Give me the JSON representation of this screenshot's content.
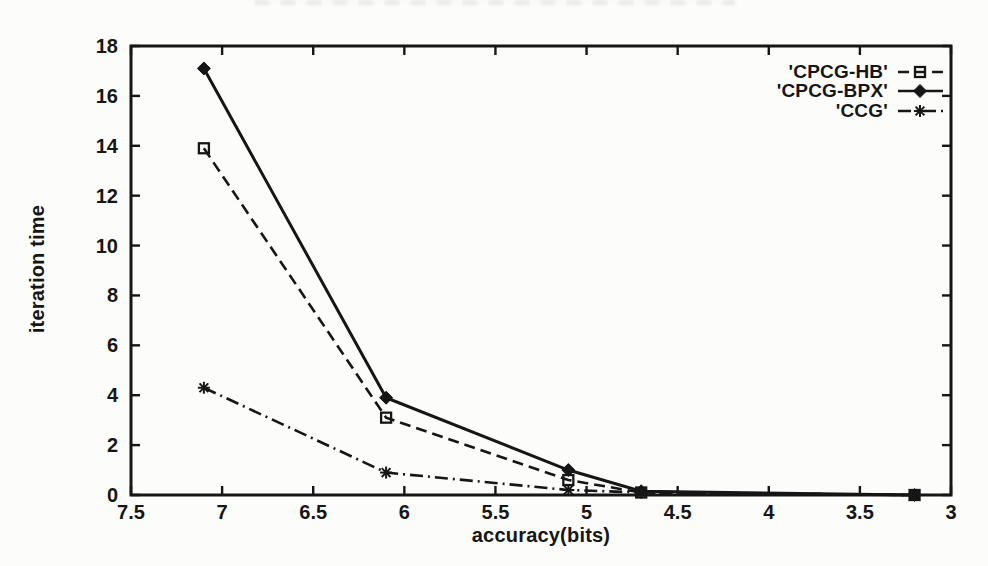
{
  "figure": {
    "background": "#fcfcfb",
    "ink_color": "#161616"
  },
  "chart_data": {
    "type": "line",
    "title": "",
    "xlabel": "accuracy(bits)",
    "ylabel": "iteration time",
    "grid": false,
    "legend_position": "top-right-inside",
    "x_axis": {
      "min": 7.5,
      "max": 3,
      "reversed": true,
      "tick_labels": [
        "7.5",
        "7",
        "6.5",
        "6",
        "5.5",
        "5",
        "4.5",
        "4",
        "3.5",
        "3"
      ],
      "ticks": [
        7.5,
        7,
        6.5,
        6,
        5.5,
        5,
        4.5,
        4,
        3.5,
        3
      ]
    },
    "y_axis": {
      "min": 0,
      "max": 18,
      "tick_labels": [
        "0",
        "2",
        "4",
        "6",
        "8",
        "10",
        "12",
        "14",
        "16",
        "18"
      ],
      "ticks": [
        0,
        2,
        4,
        6,
        8,
        10,
        12,
        14,
        16,
        18
      ]
    },
    "x": [
      7.1,
      6.1,
      5.1,
      4.7,
      3.2
    ],
    "series": [
      {
        "name": "'CPCG-HB'",
        "values": [
          13.9,
          3.1,
          0.6,
          0.1,
          0.0
        ],
        "line_style": "dashed",
        "marker": "open-square"
      },
      {
        "name": "'CPCG-BPX'",
        "values": [
          17.1,
          3.9,
          1.0,
          0.15,
          0.0
        ],
        "line_style": "solid",
        "marker": "filled-diamond"
      },
      {
        "name": "'CCG'",
        "values": [
          4.3,
          0.9,
          0.2,
          0.1,
          0.0
        ],
        "line_style": "dashdot",
        "marker": "star"
      }
    ]
  }
}
